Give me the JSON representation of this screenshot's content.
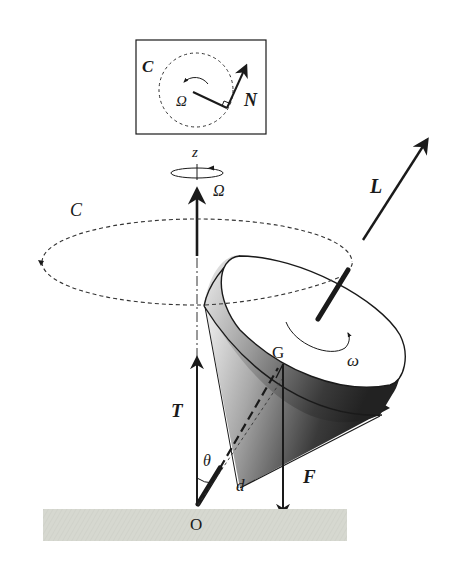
{
  "diagram": {
    "colors": {
      "ink": "#1a1a1a",
      "ground": "#d6d8d0",
      "cone_light": "#f2f2f2",
      "cone_dark": "#2a2a2a",
      "background": "#ffffff"
    },
    "inset": {
      "circle_label": "C",
      "precession_label": "Ω",
      "torque_label": "N"
    },
    "main": {
      "axis_label": "z",
      "precession_label": "Ω",
      "circle_label": "C",
      "angular_momentum_label": "L",
      "spin_label": "ω",
      "center_of_mass_label": "G",
      "normal_force_label": "T",
      "angle_label": "θ",
      "lever_arm_label": "d",
      "gravity_force_label": "F",
      "pivot_label": "O"
    }
  }
}
